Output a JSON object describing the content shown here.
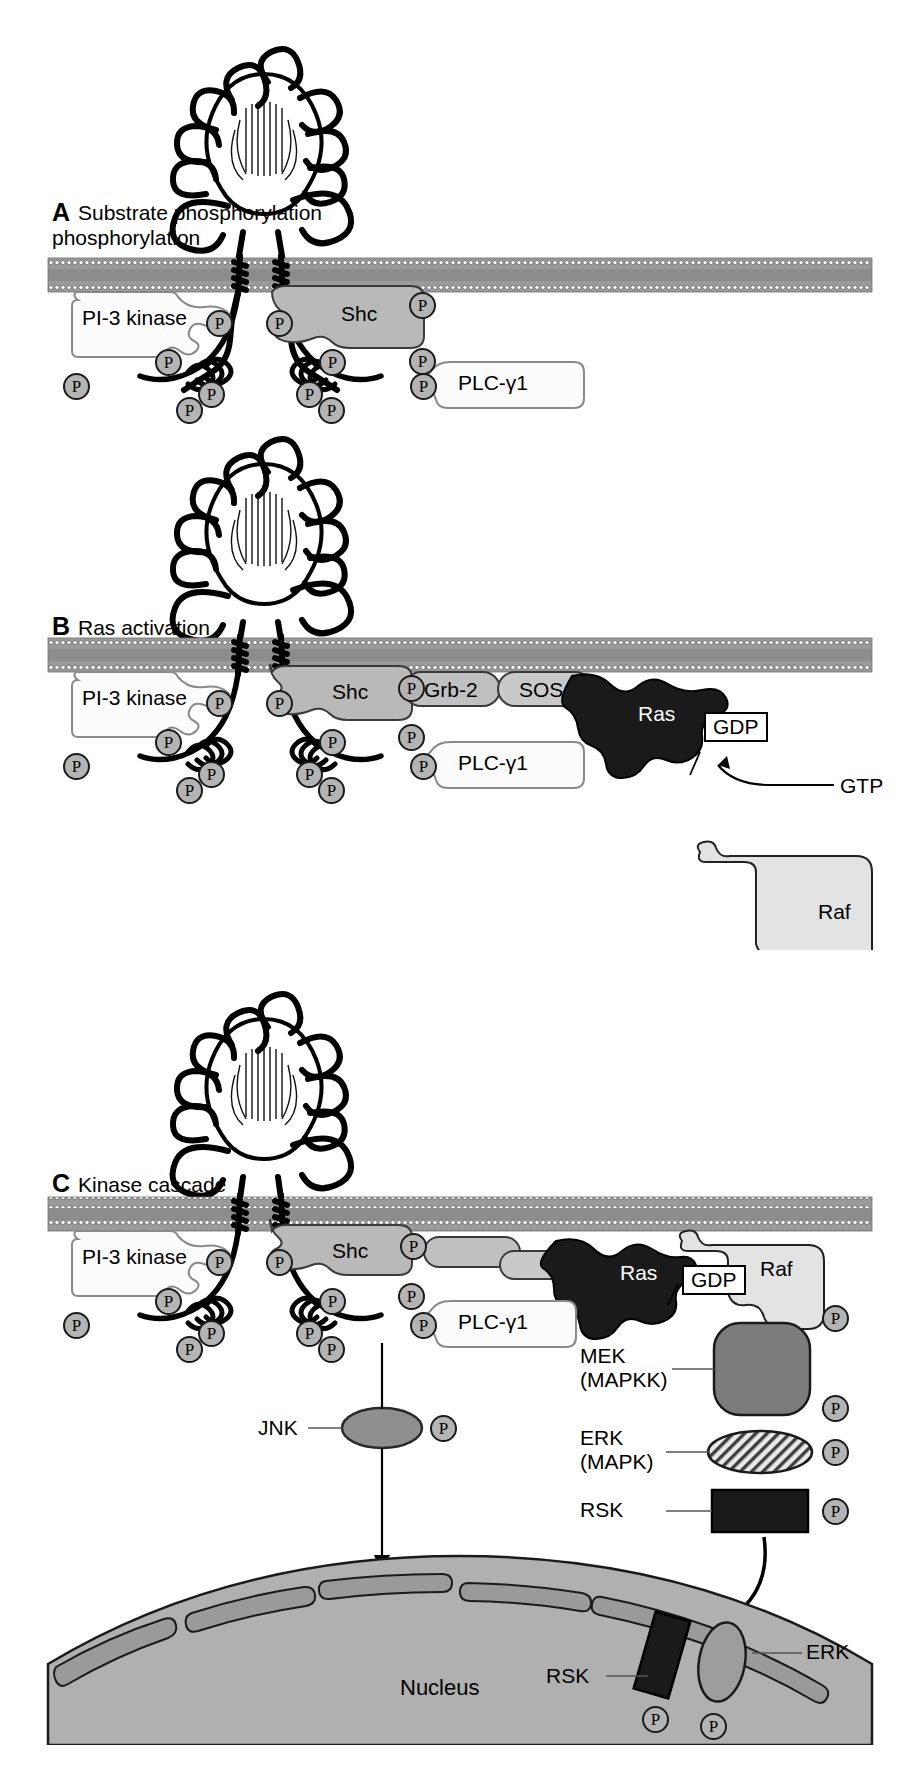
{
  "figure": {
    "type": "biological-pathway-diagram",
    "panel_count": 3
  },
  "colors": {
    "membrane_fill": "#8c8c8c",
    "membrane_edge": "#c8c8c8",
    "shc_fill": "#b9b9b9",
    "grb2_fill": "#c0c0c0",
    "sos_fill": "#c9c9c9",
    "ras_fill": "#1a1a1a",
    "raf_fill": "#e3e3e3",
    "plc_fill": "#fbfbfb",
    "pi3k_fill": "#fcfcfc",
    "mek_fill": "#7c7c7c",
    "erk_fill": "#cfcfcf",
    "rsk_fill": "#1a1a1a",
    "jnk_fill": "#8f8f8f",
    "nucleus_fill": "#b0b0b0",
    "nucleus_rim": "#8a8a8a",
    "phospho_fill": "#b4b4b4",
    "outline": "#000000"
  },
  "panels": [
    {
      "id": "A",
      "letter": "A",
      "title": "Substrate phosphorylation",
      "proteins": [
        {
          "name": "PI-3 kinase"
        },
        {
          "name": "Shc"
        },
        {
          "name": "PLC-γ1"
        }
      ],
      "phospho_label": "P",
      "phospho_count": 12
    },
    {
      "id": "B",
      "letter": "B",
      "title": "Ras activation",
      "proteins": [
        {
          "name": "PI-3 kinase"
        },
        {
          "name": "Shc"
        },
        {
          "name": "Grb-2"
        },
        {
          "name": "SOS"
        },
        {
          "name": "Ras"
        },
        {
          "name": "PLC-γ1"
        },
        {
          "name": "Raf"
        }
      ],
      "nucleotide_box": "GDP",
      "nucleotide_arrow_label": "GTP",
      "phospho_label": "P",
      "phospho_count": 13
    },
    {
      "id": "C",
      "letter": "C",
      "title": "Kinase cascade",
      "proteins": [
        {
          "name": "PI-3 kinase"
        },
        {
          "name": "Shc"
        },
        {
          "name": "Ras"
        },
        {
          "name": "PLC-γ1"
        },
        {
          "name": "Raf"
        }
      ],
      "nucleotide_box": "GDP",
      "cascade": [
        {
          "name": "MEK",
          "alias": "(MAPKK)",
          "phospho_tags": 2
        },
        {
          "name": "ERK",
          "alias": "(MAPK)",
          "phospho_tags": 1
        },
        {
          "name": "RSK",
          "alias": "",
          "phospho_tags": 1
        }
      ],
      "jnk": {
        "name": "JNK",
        "phospho_tags": 1
      },
      "nucleus": {
        "label": "Nucleus"
      },
      "nuclear_entry": [
        {
          "name": "RSK",
          "phospho_tags": 1
        },
        {
          "name": "ERK",
          "phospho_tags": 1
        }
      ],
      "phospho_label": "P",
      "phospho_count": 12
    }
  ]
}
